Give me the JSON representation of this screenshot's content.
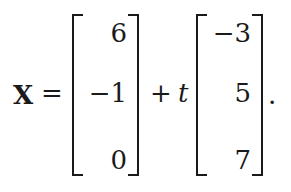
{
  "equation": {
    "lhs": "X",
    "equals": "=",
    "plus": "+",
    "parameter": "t",
    "terminator": ".",
    "vector_point": [
      "6",
      "−1",
      "0"
    ],
    "vector_direction": [
      "−3",
      "5",
      "7"
    ]
  }
}
